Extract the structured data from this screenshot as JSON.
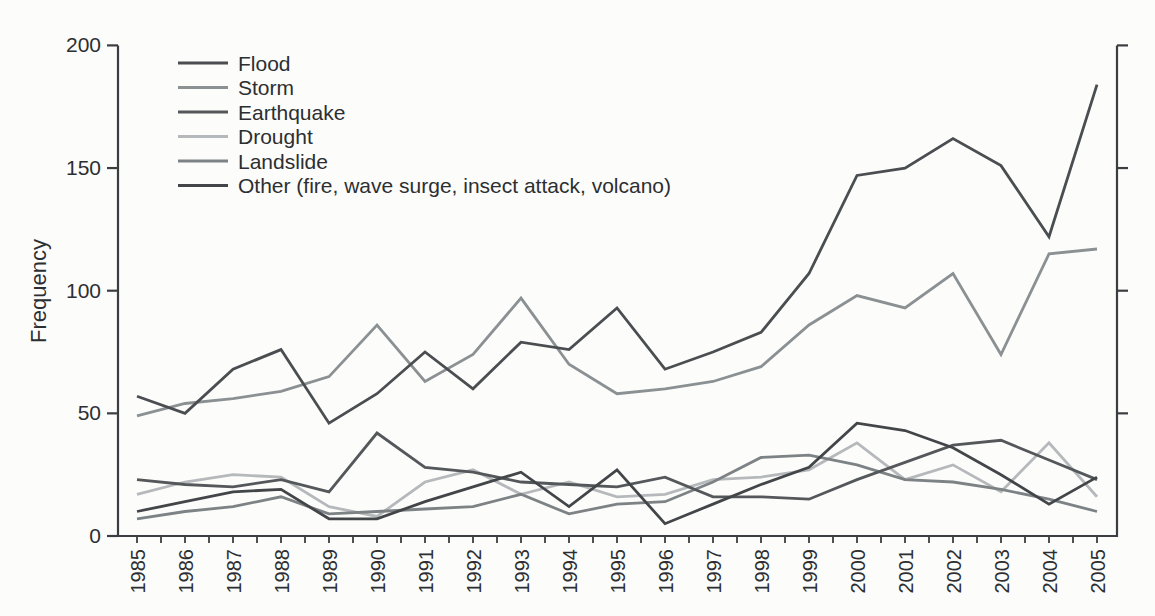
{
  "figure": {
    "background": "#fcfcfb",
    "axis_color": "#3b3e40",
    "text_color": "#2c2f31"
  },
  "chart_data": {
    "type": "line",
    "title": "",
    "xlabel": "",
    "ylabel": "Frequency",
    "ylim": [
      0,
      200
    ],
    "yticks_major": [
      0,
      50,
      100,
      150,
      200
    ],
    "x_range": [
      1985,
      2005
    ],
    "xtick_minor_step": 0.5,
    "grid": false,
    "legend_position": "top-left-inside",
    "x": [
      1985,
      1986,
      1987,
      1988,
      1989,
      1990,
      1991,
      1992,
      1993,
      1994,
      1995,
      1996,
      1997,
      1998,
      1999,
      2000,
      2001,
      2002,
      2003,
      2004,
      2005
    ],
    "x_labels": [
      "1985",
      "1986",
      "1987",
      "1988",
      "1989",
      "1990",
      "1991",
      "1992",
      "1993",
      "1994",
      "1995",
      "1996",
      "1997",
      "1998",
      "1999",
      "2000",
      "2001",
      "2002",
      "2003",
      "2004",
      "2005"
    ],
    "series": [
      {
        "name": "Flood",
        "color": "#4a4e51",
        "values": [
          57,
          50,
          68,
          76,
          46,
          58,
          75,
          60,
          79,
          76,
          93,
          68,
          75,
          83,
          107,
          147,
          150,
          162,
          151,
          122,
          184
        ]
      },
      {
        "name": "Storm",
        "color": "#8b9093",
        "values": [
          49,
          54,
          56,
          59,
          65,
          86,
          63,
          74,
          97,
          70,
          58,
          60,
          63,
          69,
          86,
          98,
          93,
          107,
          74,
          115,
          117
        ]
      },
      {
        "name": "Earthquake",
        "color": "#54585b",
        "values": [
          23,
          21,
          20,
          23,
          18,
          42,
          28,
          26,
          22,
          21,
          20,
          24,
          16,
          16,
          15,
          23,
          30,
          37,
          39,
          31,
          23
        ]
      },
      {
        "name": "Drought",
        "color": "#b6b9bb",
        "values": [
          17,
          22,
          25,
          24,
          12,
          8,
          22,
          27,
          17,
          22,
          16,
          17,
          23,
          24,
          27,
          38,
          23,
          29,
          18,
          38,
          16
        ]
      },
      {
        "name": "Landslide",
        "color": "#7d8285",
        "values": [
          7,
          10,
          12,
          16,
          9,
          10,
          11,
          12,
          17,
          9,
          13,
          14,
          22,
          32,
          33,
          29,
          23,
          22,
          19,
          15,
          10
        ]
      },
      {
        "name": "Other (fire, wave surge, insect attack, volcano)",
        "color": "#434649",
        "values": [
          10,
          14,
          18,
          19,
          7,
          7,
          14,
          20,
          26,
          12,
          27,
          5,
          13,
          21,
          28,
          46,
          43,
          36,
          25,
          13,
          24
        ]
      }
    ]
  }
}
